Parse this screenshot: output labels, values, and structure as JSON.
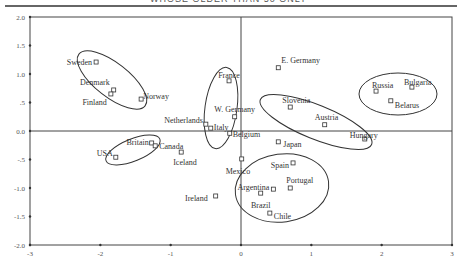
{
  "header": {
    "text": "WHOSE OLDER THAN 50 ONLY"
  },
  "chart_data": {
    "type": "scatter",
    "title": "",
    "xlabel": "",
    "ylabel": "",
    "xlim": [
      -3,
      3
    ],
    "ylim": [
      -2,
      2
    ],
    "grid": false,
    "reference_lines": {
      "x": 0,
      "y": 0
    },
    "x_ticks": [
      "-3",
      "-2",
      "-1",
      "0",
      "1",
      "2",
      "3"
    ],
    "y_ticks": [
      "2.0",
      "1.5",
      "1.0",
      ".5",
      "0.0",
      "-.5",
      "-1.0",
      "-1.5",
      "-2.0"
    ],
    "points": [
      {
        "label": "Sweden",
        "x": -2.06,
        "y": 1.21
      },
      {
        "label": "Denmark",
        "x": -1.81,
        "y": 0.72
      },
      {
        "label": "Finland",
        "x": -1.85,
        "y": 0.65
      },
      {
        "label": "Norway",
        "x": -1.42,
        "y": 0.56
      },
      {
        "label": "France",
        "x": -0.17,
        "y": 0.88
      },
      {
        "label": "E. Germany",
        "x": 0.53,
        "y": 1.11
      },
      {
        "label": "W. Germany",
        "x": -0.09,
        "y": 0.25
      },
      {
        "label": "Netherlands",
        "x": -0.5,
        "y": 0.12
      },
      {
        "label": "Italy",
        "x": -0.43,
        "y": 0.05
      },
      {
        "label": "Slovenia",
        "x": 0.7,
        "y": 0.42
      },
      {
        "label": "Austria",
        "x": 1.19,
        "y": 0.11
      },
      {
        "label": "Hungary",
        "x": 1.76,
        "y": -0.14
      },
      {
        "label": "Russia",
        "x": 1.92,
        "y": 0.7
      },
      {
        "label": "Bulgaria",
        "x": 2.43,
        "y": 0.77
      },
      {
        "label": "Belarus",
        "x": 2.13,
        "y": 0.53
      },
      {
        "label": "Belgium",
        "x": -0.16,
        "y": -0.04
      },
      {
        "label": "Japan",
        "x": 0.53,
        "y": -0.19
      },
      {
        "label": "Britain",
        "x": -1.27,
        "y": -0.21
      },
      {
        "label": "Canada",
        "x": -1.22,
        "y": -0.26
      },
      {
        "label": "USA",
        "x": -1.78,
        "y": -0.46
      },
      {
        "label": "Iceland",
        "x": -0.85,
        "y": -0.37
      },
      {
        "label": "Mexico",
        "x": 0.01,
        "y": -0.49
      },
      {
        "label": "Spain",
        "x": 0.74,
        "y": -0.56
      },
      {
        "label": "Portugal",
        "x": 0.7,
        "y": -1.0
      },
      {
        "label": "Argentina",
        "x": 0.46,
        "y": -1.02
      },
      {
        "label": "Brazil",
        "x": 0.28,
        "y": -1.09
      },
      {
        "label": "Chile",
        "x": 0.41,
        "y": -1.44
      },
      {
        "label": "Ireland",
        "x": -0.36,
        "y": -1.14
      }
    ],
    "clusters": [
      {
        "name": "Nordic",
        "members": [
          "Sweden",
          "Denmark",
          "Finland",
          "Norway"
        ]
      },
      {
        "name": "Western Europe",
        "members": [
          "France",
          "W. Germany",
          "Netherlands",
          "Italy"
        ]
      },
      {
        "name": "Central Europe",
        "members": [
          "Slovenia",
          "Austria",
          "Hungary"
        ]
      },
      {
        "name": "Eastern Europe",
        "members": [
          "Russia",
          "Bulgaria",
          "Belarus"
        ]
      },
      {
        "name": "Anglo",
        "members": [
          "Britain",
          "Canada",
          "USA"
        ]
      },
      {
        "name": "Latin",
        "members": [
          "Mexico",
          "Spain",
          "Portugal",
          "Argentina",
          "Brazil",
          "Chile"
        ]
      }
    ]
  }
}
